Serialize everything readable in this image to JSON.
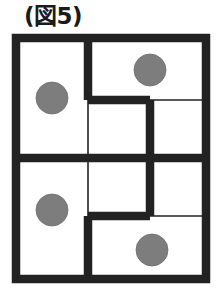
{
  "figure": {
    "caption": "(図5)",
    "caption_icon": "figure-label",
    "colors": {
      "wall": "#222222",
      "grid_line": "#222222",
      "dot": "#7d7d7d",
      "cell_background": "#ffffff",
      "page_background": "#ffffff"
    },
    "grid": {
      "columns": 3,
      "rows": 4,
      "x_positions": [
        16,
        88,
        150,
        206
      ],
      "y_positions": [
        38,
        100,
        158,
        216,
        279
      ],
      "thick_wall_width": 8.5,
      "thin_line_width": 1.6
    },
    "outer_border": {
      "x": 16,
      "y": 38,
      "width": 190,
      "height": 241
    },
    "thin_lines": [
      {
        "name": "thin-vertical-col1-mid",
        "x1": 88,
        "y1": 100,
        "x2": 88,
        "y2": 216
      },
      {
        "name": "thin-horizontal-row1-right",
        "x1": 150,
        "y1": 100,
        "x2": 206,
        "y2": 100
      },
      {
        "name": "thin-horizontal-row3-right",
        "x1": 150,
        "y1": 216,
        "x2": 206,
        "y2": 216
      }
    ],
    "thick_walls": [
      {
        "name": "wall-vertical-top-left-divider",
        "x1": 88,
        "y1": 38,
        "x2": 88,
        "y2": 100
      },
      {
        "name": "wall-horizontal-upper-step",
        "x1": 88,
        "y1": 100,
        "x2": 150,
        "y2": 100
      },
      {
        "name": "wall-vertical-center-long",
        "x1": 150,
        "y1": 100,
        "x2": 150,
        "y2": 216
      },
      {
        "name": "wall-horizontal-lower-step",
        "x1": 88,
        "y1": 216,
        "x2": 150,
        "y2": 216
      },
      {
        "name": "wall-vertical-bottom-left-divider",
        "x1": 88,
        "y1": 216,
        "x2": 88,
        "y2": 279
      },
      {
        "name": "wall-horizontal-middle-full",
        "x1": 16,
        "y1": 158,
        "x2": 206,
        "y2": 158
      }
    ],
    "dots": [
      {
        "name": "dot-left-upper",
        "cx": 52,
        "cy": 98,
        "r": 16,
        "row": 1,
        "column": 1
      },
      {
        "name": "dot-right-top",
        "cx": 150,
        "cy": 70,
        "r": 16,
        "row": 1,
        "column": 2
      },
      {
        "name": "dot-left-lower",
        "cx": 52,
        "cy": 210,
        "r": 16,
        "row": 3,
        "column": 1
      },
      {
        "name": "dot-right-bottom",
        "cx": 152,
        "cy": 250,
        "r": 16,
        "row": 4,
        "column": 2
      }
    ],
    "dot_count": 4
  }
}
